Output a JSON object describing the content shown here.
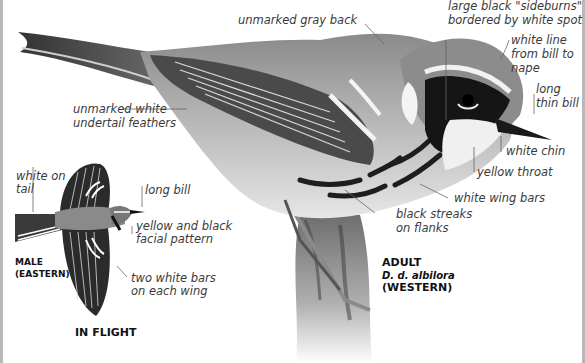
{
  "colors": {
    "background": "#ffffff",
    "label_text": "#3a3a3a",
    "caption_text": "#111111",
    "leader_line": "#666666",
    "border": "#b8b8b8"
  },
  "main_bird": {
    "caption": {
      "age": "ADULT",
      "subspecies": "D. d. albilora",
      "region": "(WESTERN)"
    },
    "labels": {
      "back": "unmarked gray back",
      "sideburns_1": "large black \"sideburns\"",
      "sideburns_2": "bordered by white spot",
      "white_line_1": "white line",
      "white_line_2": "from bill to",
      "white_line_3": "nape",
      "bill_1": "long",
      "bill_2": "thin bill",
      "undertail_1": "unmarked white",
      "undertail_2": "undertail feathers",
      "chin": "white chin",
      "throat": "yellow throat",
      "wing_bars": "white wing bars",
      "streaks_1": "black streaks",
      "streaks_2": "on flanks"
    }
  },
  "flight_bird": {
    "caption_sex": "MALE",
    "caption_region": "(EASTERN)",
    "title": "IN FLIGHT",
    "labels": {
      "tail_1": "white on",
      "tail_2": "tail",
      "bill": "long bill",
      "facial_1": "yellow and black",
      "facial_2": "facial pattern",
      "wing_1": "two white bars",
      "wing_2": "on each wing"
    }
  }
}
